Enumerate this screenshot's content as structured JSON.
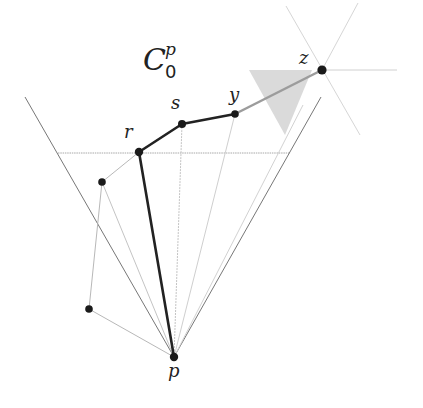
{
  "diagram": {
    "title": {
      "base": "C",
      "superscript": "p",
      "subscript": "0"
    },
    "colors": {
      "background": "#ffffff",
      "chain": "#222222",
      "point": "#1a1a1a",
      "thin_line": "#9a9a9a",
      "faint_line": "#cfcfcf",
      "cone_line": "#6e6e6e",
      "shade": "#d4d4d4",
      "segment_yz": "#9c9c9c"
    },
    "points": {
      "p": {
        "label": "p",
        "x": 174,
        "y": 357
      },
      "r": {
        "label": "r",
        "x": 139,
        "y": 152
      },
      "s": {
        "label": "s",
        "x": 182,
        "y": 124
      },
      "y": {
        "label": "y",
        "x": 235,
        "y": 114
      },
      "z": {
        "label": "z",
        "x": 322,
        "y": 70
      },
      "a": {
        "label": "",
        "x": 102,
        "y": 182
      },
      "b": {
        "label": "",
        "x": 89,
        "y": 309
      }
    },
    "labels": {
      "p": "p",
      "r": "r",
      "s": "s",
      "y": "y",
      "z": "z"
    }
  }
}
